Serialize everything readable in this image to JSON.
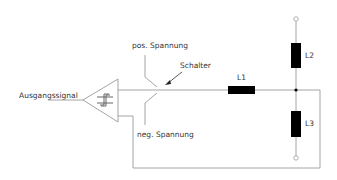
{
  "diagram": {
    "type": "circuit-schematic",
    "labels": {
      "output_signal": "Ausgangssignal",
      "pos_voltage": "pos. Spannung",
      "neg_voltage": "neg. Spannung",
      "switch": "Schalter",
      "coil_1": "L1",
      "coil_2": "L2",
      "coil_3": "L3"
    },
    "components": [
      {
        "id": "comparator",
        "kind": "schmitt-trigger-amplifier"
      },
      {
        "id": "switch",
        "kind": "changeover-switch"
      },
      {
        "id": "L1",
        "kind": "inductor"
      },
      {
        "id": "L2",
        "kind": "inductor"
      },
      {
        "id": "L3",
        "kind": "inductor"
      }
    ],
    "colors": {
      "wire": "#9a9a9a",
      "component_fill": "#000000",
      "text": "#333333"
    }
  }
}
